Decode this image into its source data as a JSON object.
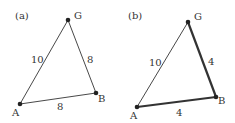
{
  "colors": {
    "line": "#333333",
    "node": "#222222",
    "text": "#333333",
    "background": "#ffffff"
  },
  "panels": [
    {
      "label": "(a)",
      "nodes": [
        {
          "name": "G",
          "x": 68,
          "y": 20
        },
        {
          "name": "A",
          "x": 20,
          "y": 104
        },
        {
          "name": "B",
          "x": 96,
          "y": 93
        }
      ],
      "edges": [
        {
          "from": "A",
          "to": "G",
          "weight": "10",
          "bold": false
        },
        {
          "from": "G",
          "to": "B",
          "weight": "8",
          "bold": false
        },
        {
          "from": "A",
          "to": "B",
          "weight": "8",
          "bold": false
        }
      ]
    },
    {
      "label": "(b)",
      "nodes": [
        {
          "name": "G",
          "x": 188,
          "y": 22
        },
        {
          "name": "A",
          "x": 137,
          "y": 107
        },
        {
          "name": "B",
          "x": 216,
          "y": 97
        }
      ],
      "edges": [
        {
          "from": "A",
          "to": "G",
          "weight": "10",
          "bold": false
        },
        {
          "from": "G",
          "to": "B",
          "weight": "4",
          "bold": true
        },
        {
          "from": "A",
          "to": "B",
          "weight": "4",
          "bold": true
        }
      ]
    }
  ]
}
